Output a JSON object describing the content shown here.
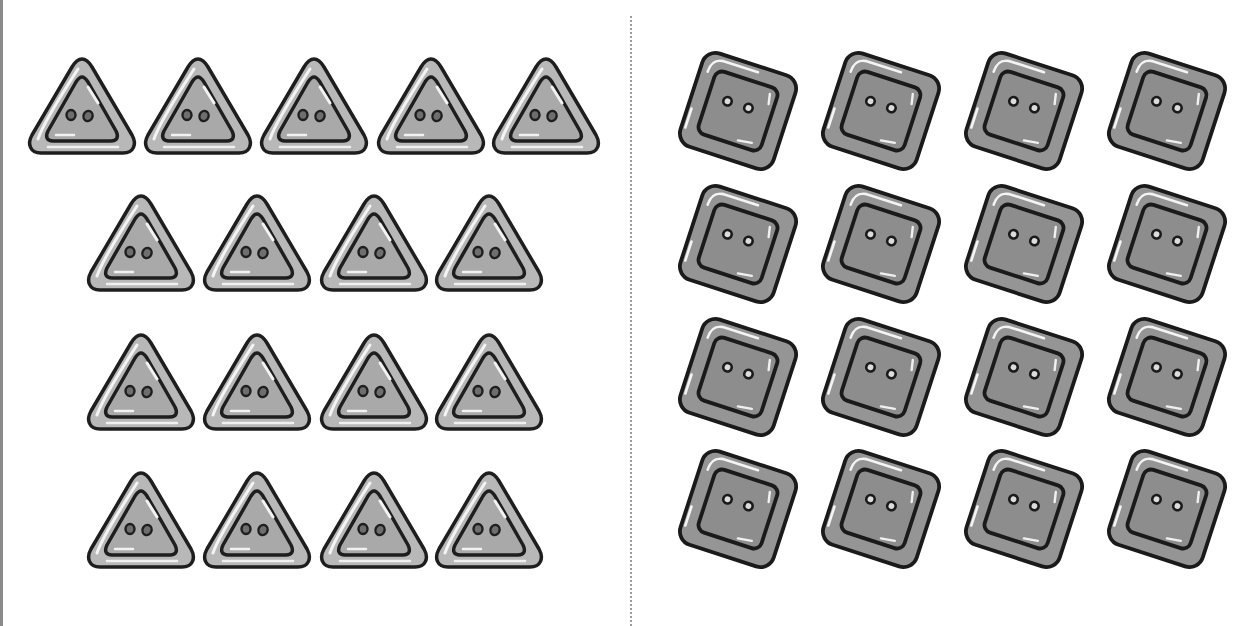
{
  "worksheet": {
    "left_group": {
      "shape": "triangle-button",
      "count": 17,
      "rows": [
        5,
        4,
        4,
        4
      ],
      "color_face": "#a9a9a9",
      "color_rim": "#b8b8b8",
      "color_outline": "#1e1e1e"
    },
    "right_group": {
      "shape": "square-button",
      "count": 16,
      "rows": [
        4,
        4,
        4,
        4
      ],
      "color_face": "#8d8d8d",
      "color_rim": "#959595",
      "color_outline": "#1a1a1a"
    },
    "divider": "dotted-line"
  }
}
